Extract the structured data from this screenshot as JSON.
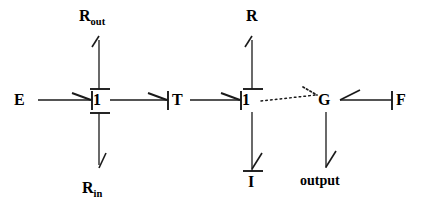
{
  "diagram": {
    "type": "bond-graph",
    "stroke_color": "#1a1a1a",
    "background": "#ffffff",
    "nodes": [
      {
        "id": "E",
        "label": "E",
        "kind": "source",
        "x": 22,
        "y": 100
      },
      {
        "id": "J1",
        "label": "1",
        "kind": "one-junction",
        "x": 97,
        "y": 100
      },
      {
        "id": "Rout",
        "label": "R",
        "sub": "out",
        "kind": "element",
        "x": 96,
        "y": 18
      },
      {
        "id": "Rin",
        "label": "R",
        "sub": "in",
        "kind": "element",
        "x": 96,
        "y": 188
      },
      {
        "id": "T",
        "label": "T",
        "kind": "transformer",
        "x": 178,
        "y": 100
      },
      {
        "id": "J2",
        "label": "1",
        "kind": "one-junction",
        "x": 246,
        "y": 100
      },
      {
        "id": "R",
        "label": "R",
        "kind": "element",
        "x": 249,
        "y": 18
      },
      {
        "id": "I",
        "label": "I",
        "kind": "element",
        "x": 248,
        "y": 188
      },
      {
        "id": "G",
        "label": "G",
        "kind": "gyrator",
        "x": 323,
        "y": 100
      },
      {
        "id": "output",
        "label": "output",
        "kind": "output",
        "x": 323,
        "y": 188
      },
      {
        "id": "F",
        "label": "F",
        "kind": "source",
        "x": 400,
        "y": 100
      }
    ],
    "bonds": [
      {
        "from": "E",
        "to": "J1",
        "style": "solid",
        "arrow": "at-target",
        "causal_stroke": "none"
      },
      {
        "from": "Rout",
        "to": "J1",
        "style": "solid",
        "arrow": "at-source",
        "causal_stroke": "target-top"
      },
      {
        "from": "J1",
        "to": "Rin",
        "style": "solid",
        "arrow": "at-target",
        "causal_stroke": "source-bottom"
      },
      {
        "from": "J1",
        "to": "T",
        "style": "solid",
        "arrow": "at-target",
        "causal_stroke": "target-left"
      },
      {
        "from": "T",
        "to": "J2",
        "style": "solid",
        "arrow": "at-target",
        "causal_stroke": "target-left"
      },
      {
        "from": "R",
        "to": "J2",
        "style": "solid",
        "arrow": "at-source",
        "causal_stroke": "target-top"
      },
      {
        "from": "J2",
        "to": "I",
        "style": "solid",
        "arrow": "at-target",
        "causal_stroke": "target-top"
      },
      {
        "from": "J2",
        "to": "G",
        "style": "dotted",
        "arrow": "at-target",
        "causal_stroke": "none"
      },
      {
        "from": "F",
        "to": "G",
        "style": "solid",
        "arrow": "at-target",
        "causal_stroke": "source-left"
      },
      {
        "from": "G",
        "to": "output",
        "style": "solid",
        "arrow": "at-target",
        "causal_stroke": "none"
      }
    ],
    "labels": {
      "e_source": "E",
      "junction_left": "1",
      "r_out": "R",
      "r_out_sub": "out",
      "r_in": "R",
      "r_in_sub": "in",
      "transformer": "T",
      "junction_right": "1",
      "resistor": "R",
      "inertia": "I",
      "gyrator": "G",
      "output": "output",
      "f_source": "F"
    }
  }
}
